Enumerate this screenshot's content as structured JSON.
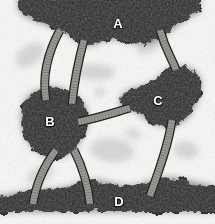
{
  "figure": {
    "width": 215,
    "height": 224,
    "background_color": "#fbfbfa",
    "mass_color": "#242424",
    "tube_fill_color": "#9b9893",
    "tube_outline_color": "#1d1d1d",
    "label_color": "#ffffff"
  },
  "labels": [
    {
      "id": "A",
      "text": "A",
      "x": 118,
      "y": 23
    },
    {
      "id": "B",
      "text": "B",
      "x": 50,
      "y": 121
    },
    {
      "id": "C",
      "text": "C",
      "x": 158,
      "y": 100
    },
    {
      "id": "D",
      "text": "D",
      "x": 119,
      "y": 201
    }
  ],
  "masses": [
    {
      "id": "mass-a",
      "label": "A",
      "description": "top electron-dense band",
      "path": "M 18 -10 L 200 -10 L 200 12 C 190 16 182 22 172 30 C 160 40 150 45 138 44 C 126 43 118 38 108 40 C 98 42 92 48 84 45 C 76 42 70 34 60 30 C 48 25 34 22 24 16 C 20 13 18 10 18 4 Z"
    },
    {
      "id": "mass-b",
      "label": "B",
      "description": "left-centre electron-dense globule",
      "path": "M 46 88 C 55 85 63 88 70 93 C 78 98 84 100 86 108 C 89 117 88 126 84 134 C 80 143 74 152 65 156 C 56 160 46 158 38 152 C 30 146 24 138 22 128 C 20 118 21 107 26 99 C 31 91 38 90 46 88 Z"
    },
    {
      "id": "mass-c",
      "label": "C",
      "description": "right-centre electron-dense globule",
      "path": "M 178 66 C 188 66 197 70 200 78 C 203 87 200 96 196 104 C 192 113 187 120 179 124 C 171 128 162 127 154 124 C 147 121 142 115 136 112 C 129 109 122 110 120 104 C 118 97 124 92 131 89 C 139 86 147 86 154 81 C 162 75 168 66 178 66 Z"
    },
    {
      "id": "mass-d",
      "label": "D",
      "description": "bottom electron-dense band",
      "path": "M -10 212 L 225 212 L 225 190 C 214 186 204 184 194 182 C 182 179 172 176 160 178 C 148 180 140 186 128 186 C 116 186 108 180 96 180 C 84 180 74 186 62 188 C 50 190 38 189 26 191 C 14 193 2 196 -10 198 Z"
    }
  ],
  "tubes": [
    {
      "id": "tube-a-b-outer",
      "description": "outer arc from mass A down-left to mass B",
      "path": "M 60 30 C 48 52 42 76 46 100",
      "width": 9
    },
    {
      "id": "tube-a-b-inner",
      "description": "inner arc from mass A down to mass B",
      "path": "M 84 40 C 78 62 74 84 72 104",
      "width": 9
    },
    {
      "id": "tube-a-c",
      "description": "long arc from mass A right side down to mass C",
      "path": "M 160 30 C 166 52 172 58 176 70",
      "width": 9
    },
    {
      "id": "tube-b-c",
      "description": "horizontal connector between mass B and mass C",
      "path": "M 78 122 C 98 118 116 112 130 108",
      "width": 9
    },
    {
      "id": "tube-b-d-left",
      "description": "arc from mass B down-left to mass D",
      "path": "M 56 150 C 44 166 36 184 33 204",
      "width": 9
    },
    {
      "id": "tube-b-d-right",
      "description": "arc from mass B down-right to mass D",
      "path": "M 74 150 C 82 166 88 184 90 204",
      "width": 9
    },
    {
      "id": "tube-c-d",
      "description": "arc from mass C down to mass D",
      "path": "M 172 120 C 168 148 158 172 150 196",
      "width": 9
    }
  ],
  "texture": {
    "grain_description": "fine stochastic granular noise over the whole field",
    "faint_blobs": [
      {
        "cx": 30,
        "cy": 55,
        "rx": 16,
        "ry": 10
      },
      {
        "cx": 95,
        "cy": 72,
        "rx": 20,
        "ry": 8
      },
      {
        "cx": 150,
        "cy": 45,
        "rx": 14,
        "ry": 7
      },
      {
        "cx": 112,
        "cy": 150,
        "rx": 22,
        "ry": 12
      },
      {
        "cx": 40,
        "cy": 175,
        "rx": 14,
        "ry": 8
      },
      {
        "cx": 186,
        "cy": 150,
        "rx": 12,
        "ry": 9
      },
      {
        "cx": 100,
        "cy": 92,
        "rx": 6,
        "ry": 4
      },
      {
        "cx": 133,
        "cy": 134,
        "rx": 8,
        "ry": 5
      }
    ]
  }
}
